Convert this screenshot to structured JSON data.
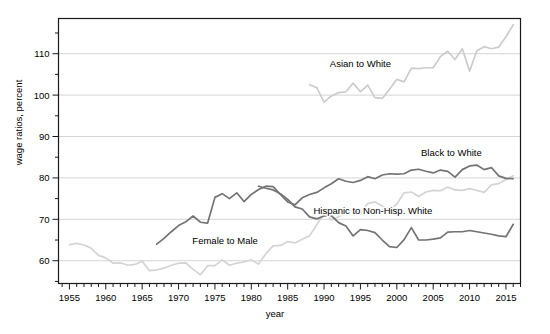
{
  "chart_data": {
    "type": "line",
    "title": "",
    "xlabel": "year",
    "ylabel": "wage ratios, percent",
    "xlim": [
      1953.5,
      2017.0
    ],
    "ylim": [
      54.5,
      118.5
    ],
    "grid": true,
    "grid_axis": "y",
    "legend_position": "inline-annotations",
    "xticks_major": [
      1955,
      1960,
      1965,
      1970,
      1975,
      1980,
      1985,
      1990,
      1995,
      2000,
      2005,
      2010,
      2015
    ],
    "xticks_minor_step": 1,
    "yticks_major": [
      60,
      70,
      80,
      90,
      100,
      110
    ],
    "yticks_minor": [
      55,
      65,
      75,
      85,
      95,
      105,
      115
    ],
    "series": [
      {
        "name": "Female to Male",
        "color": "#d4d4d4",
        "label_x": 1976.4,
        "label_y": 64.0,
        "x": [
          1955,
          1956,
          1957,
          1958,
          1959,
          1960,
          1961,
          1962,
          1963,
          1964,
          1965,
          1966,
          1967,
          1968,
          1969,
          1970,
          1971,
          1972,
          1973,
          1974,
          1975,
          1976,
          1977,
          1978,
          1979,
          1980,
          1981,
          1982,
          1983,
          1984,
          1985,
          1986,
          1987,
          1988,
          1989,
          1990,
          1991,
          1992,
          1993,
          1994,
          1995,
          1996,
          1997,
          1998,
          1999,
          2000,
          2001,
          2002,
          2003,
          2004,
          2005,
          2006,
          2007,
          2008,
          2009,
          2010,
          2011,
          2012,
          2013,
          2014,
          2015,
          2016
        ],
        "values": [
          63.9,
          64.2,
          63.8,
          63.0,
          61.3,
          60.7,
          59.4,
          59.5,
          58.9,
          59.1,
          59.9,
          57.6,
          57.8,
          58.2,
          58.9,
          59.4,
          59.5,
          57.9,
          56.6,
          58.8,
          58.8,
          60.2,
          58.9,
          59.4,
          59.7,
          60.2,
          59.2,
          61.7,
          63.6,
          63.7,
          64.6,
          64.3,
          65.2,
          66.0,
          68.7,
          71.6,
          69.9,
          70.6,
          71.5,
          72.0,
          71.4,
          73.8,
          74.2,
          73.2,
          72.2,
          73.7,
          76.4,
          76.6,
          75.5,
          76.6,
          77.0,
          76.9,
          77.8,
          77.1,
          77.0,
          77.4,
          77.0,
          76.5,
          78.3,
          78.6,
          79.6,
          80.5
        ]
      },
      {
        "name": "Black to White",
        "color": "#737373",
        "label_x": 2007.5,
        "label_y": 85.2,
        "x": [
          1967,
          1968,
          1969,
          1970,
          1971,
          1972,
          1973,
          1974,
          1975,
          1976,
          1977,
          1978,
          1979,
          1980,
          1981,
          1982,
          1983,
          1984,
          1985,
          1986,
          1987,
          1988,
          1989,
          1990,
          1991,
          1992,
          1993,
          1994,
          1995,
          1996,
          1997,
          1998,
          1999,
          2000,
          2001,
          2002,
          2003,
          2004,
          2005,
          2006,
          2007,
          2008,
          2009,
          2010,
          2011,
          2012,
          2013,
          2014,
          2015,
          2016
        ],
        "values": [
          64.0,
          65.4,
          67.0,
          68.5,
          69.4,
          70.8,
          69.3,
          69.1,
          75.3,
          76.2,
          75.0,
          76.4,
          74.3,
          76.0,
          77.2,
          78.0,
          77.9,
          76.0,
          74.2,
          73.5,
          75.2,
          76.0,
          76.5,
          77.6,
          78.6,
          79.8,
          79.2,
          78.9,
          79.4,
          80.3,
          79.8,
          80.7,
          81.0,
          80.9,
          81.0,
          81.9,
          82.1,
          81.6,
          81.2,
          81.9,
          81.6,
          80.2,
          82.0,
          82.9,
          83.1,
          82.0,
          82.5,
          80.5,
          79.9,
          79.8
        ]
      },
      {
        "name": "Asian to White",
        "color": "#cccccc",
        "label_x": 1995.0,
        "label_y": 106.8,
        "x": [
          1988,
          1989,
          1990,
          1991,
          1992,
          1993,
          1994,
          1995,
          1996,
          1997,
          1998,
          1999,
          2000,
          2001,
          2002,
          2003,
          2004,
          2005,
          2006,
          2007,
          2008,
          2009,
          2010,
          2011,
          2012,
          2013,
          2014,
          2015,
          2016
        ],
        "values": [
          102.5,
          101.8,
          98.3,
          99.8,
          100.6,
          100.8,
          102.9,
          100.8,
          102.4,
          99.4,
          99.2,
          101.4,
          103.8,
          103.2,
          106.5,
          106.4,
          106.6,
          106.6,
          109.3,
          110.6,
          108.6,
          111.2,
          105.8,
          110.7,
          111.7,
          111.2,
          111.6,
          114.1,
          117.0
        ]
      },
      {
        "name": "Hispanic to Non-Hisp. White",
        "color": "#737373",
        "label_x": 1996.7,
        "label_y": 71.2,
        "x": [
          1981,
          1982,
          1983,
          1984,
          1985,
          1986,
          1987,
          1988,
          1989,
          1990,
          1991,
          1992,
          1993,
          1994,
          1995,
          1996,
          1997,
          1998,
          1999,
          2000,
          2001,
          2002,
          2003,
          2004,
          2005,
          2006,
          2007,
          2008,
          2009,
          2010,
          2011,
          2012,
          2013,
          2014,
          2015,
          2016
        ],
        "values": [
          78.0,
          77.5,
          77.1,
          76.2,
          74.8,
          73.0,
          72.5,
          70.6,
          70.1,
          70.8,
          70.9,
          69.2,
          68.4,
          66.0,
          67.5,
          67.3,
          66.8,
          65.0,
          63.4,
          63.2,
          65.1,
          68.0,
          65.0,
          65.0,
          65.2,
          65.5,
          66.9,
          67.0,
          67.0,
          67.3,
          67.0,
          66.7,
          66.4,
          66.0,
          65.8,
          68.8
        ]
      }
    ]
  }
}
